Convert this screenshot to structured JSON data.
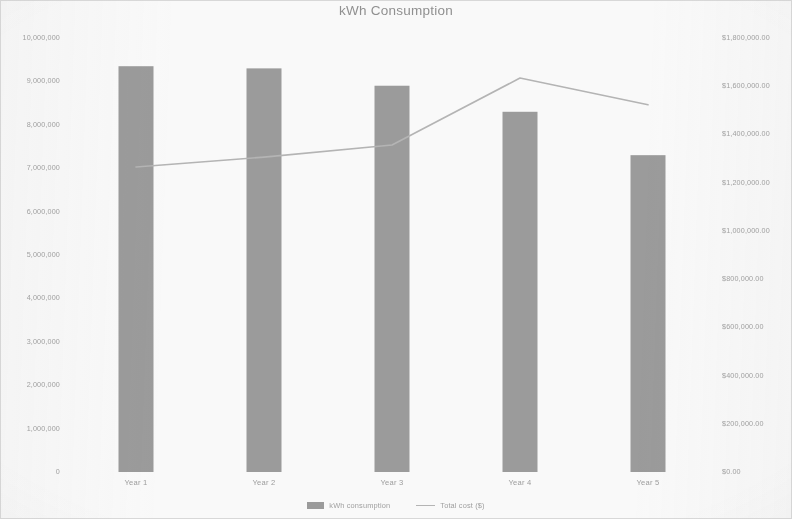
{
  "chart_data": {
    "type": "bar",
    "title": "kWh Consumption",
    "xlabel": "",
    "ylabel": "",
    "categories": [
      "Year 1",
      "Year 2",
      "Year 3",
      "Year 4",
      "Year 5"
    ],
    "grid": false,
    "legend_position": "bottom",
    "series": [
      {
        "name": "kWh consumption",
        "type": "bar",
        "axis": "left",
        "color": "#9a9a9a",
        "values": [
          9350000,
          9300000,
          8900000,
          8300000,
          7300000
        ]
      },
      {
        "name": "Total cost ($)",
        "type": "line",
        "axis": "right",
        "color": "#b4b4b4",
        "values": [
          1265000,
          1306000,
          1356000,
          1634000,
          1523000
        ]
      }
    ],
    "left_axis": {
      "min": 0,
      "max": 10000000,
      "step": 1000000,
      "tick_labels": [
        "10,000,000",
        "9,000,000",
        "8,000,000",
        "7,000,000",
        "6,000,000",
        "5,000,000",
        "4,000,000",
        "3,000,000",
        "2,000,000",
        "1,000,000",
        "0"
      ]
    },
    "right_axis": {
      "min": 0,
      "max": 1800000,
      "step": 200000,
      "tick_labels": [
        "$1,800,000.00",
        "$1,600,000.00",
        "$1,400,000.00",
        "$1,200,000.00",
        "$1,000,000.00",
        "$800,000.00",
        "$600,000.00",
        "$400,000.00",
        "$200,000.00",
        "$0.00"
      ]
    }
  }
}
